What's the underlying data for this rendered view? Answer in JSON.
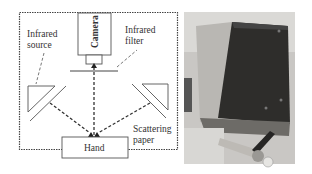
{
  "figure": {
    "schematic": {
      "labels": {
        "camera": "Camera",
        "infrared_filter_line1": "Infrared",
        "infrared_filter_line2": "filter",
        "infrared_source_line1": "Infrared",
        "infrared_source_line2": "source",
        "scattering_line1": "Scattering",
        "scattering_line2": "paper",
        "hand": "Hand"
      }
    },
    "photo": {
      "description": "photograph of the device enclosure"
    }
  }
}
